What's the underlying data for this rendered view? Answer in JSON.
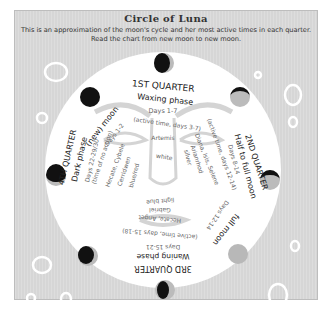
{
  "header": {
    "title": "Circle of Luna",
    "subtitle_line1": "This is an approximation of the moon's cycle and her most active times in each quarter.",
    "subtitle_line2": "Read the chart from new moon to new moon."
  },
  "quarters": {
    "first": {
      "title": "1ST QUARTER",
      "phase": "Waxing phase",
      "days": "Days 1-7",
      "active": "(active time, days 3-7)",
      "deities": [
        "Artemis"
      ],
      "color": "white"
    },
    "second": {
      "title": "2ND QUARTER",
      "phase": "Half to full moon",
      "days": "Days 8-14",
      "active": "(active time, days 12-14)",
      "deities": [
        "Diana, Isis, Selene",
        "Arianrhod"
      ],
      "color": "silver"
    },
    "third": {
      "title": "3RD QUARTER",
      "phase": "Waning phase",
      "days": "Days 15-21",
      "active": "(active time, days 15-18)",
      "deities": [
        "Hecate, Anget",
        "Gabriel"
      ],
      "color": "light blue"
    },
    "fourth": {
      "title": "4TH QUARTER",
      "phase": "Dark phase",
      "days": "Days 22-29/30",
      "active": "(time of no action)",
      "deities": [
        "Hecate, Cybele",
        "Cerridwen"
      ],
      "color": "blue/red"
    }
  },
  "markers": {
    "new_moon": {
      "label": "(new) moon",
      "days": "Days 1-2"
    },
    "full_moon": {
      "label": "full moon",
      "days": "Days 12-14"
    }
  },
  "colors": {
    "panel": "#d6d6d6",
    "disc": "#ffffff",
    "moon_dark": "#111111",
    "moon_light": "#b8b8b8",
    "bubble": "#ffffff"
  }
}
